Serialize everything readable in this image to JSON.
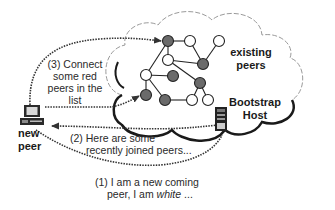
{
  "diagram": {
    "type": "p2p-bootstrap-join",
    "colors": {
      "gray_node": "#6a6a6a",
      "white_node": "#ffffff",
      "stroke": "#222222",
      "cloud_outline": "#1a1a1a",
      "dotted_arrow": "#333333",
      "text": "#2a2a2a"
    },
    "labels": {
      "existing_peers_line1": "existing",
      "existing_peers_line2": "peers",
      "bootstrap_line1": "Bootstrap",
      "bootstrap_line2": "Host",
      "new_peer_line1": "new",
      "new_peer_line2": "peer",
      "step3_line1": "(3) Connect",
      "step3_line2": "some red",
      "step3_line3": "peers in the",
      "step3_line4": "list",
      "step2_line1": "(2) Here are some",
      "step2_line2": "recently joined peers...",
      "step1_line1": "(1) I am a new coming",
      "step1_line2_prefix": "peer, I am ",
      "step1_line2_italic": "white",
      "step1_line2_suffix": " ..."
    },
    "nodes": [
      {
        "id": "A",
        "x": 168,
        "y": 41,
        "fill": "gray"
      },
      {
        "id": "B",
        "x": 190,
        "y": 41,
        "fill": "white"
      },
      {
        "id": "C",
        "x": 219,
        "y": 41,
        "fill": "white"
      },
      {
        "id": "D",
        "x": 168,
        "y": 60,
        "fill": "white"
      },
      {
        "id": "E",
        "x": 203,
        "y": 64,
        "fill": "gray"
      },
      {
        "id": "F",
        "x": 146,
        "y": 75,
        "fill": "white"
      },
      {
        "id": "G",
        "x": 173,
        "y": 76,
        "fill": "gray"
      },
      {
        "id": "H",
        "x": 200,
        "y": 83,
        "fill": "gray"
      },
      {
        "id": "I",
        "x": 146,
        "y": 95,
        "fill": "gray"
      },
      {
        "id": "J",
        "x": 165,
        "y": 100,
        "fill": "gray"
      },
      {
        "id": "K",
        "x": 192,
        "y": 100,
        "fill": "white"
      },
      {
        "id": "L",
        "x": 208,
        "y": 100,
        "fill": "white"
      }
    ],
    "edges": [
      [
        "A",
        "B"
      ],
      [
        "A",
        "D"
      ],
      [
        "A",
        "F"
      ],
      [
        "B",
        "E"
      ],
      [
        "C",
        "E"
      ],
      [
        "D",
        "E"
      ],
      [
        "D",
        "H"
      ],
      [
        "F",
        "G"
      ],
      [
        "F",
        "I"
      ],
      [
        "F",
        "J"
      ],
      [
        "J",
        "K"
      ],
      [
        "H",
        "K"
      ],
      [
        "H",
        "L"
      ]
    ],
    "arrows": [
      {
        "name": "step3-arrow-top",
        "from": "new-peer",
        "to": "A"
      },
      {
        "name": "step3-arrow-mid",
        "from": "new-peer",
        "to": "I"
      },
      {
        "name": "step2-arrow",
        "from": "bootstrap-host",
        "to": "new-peer"
      },
      {
        "name": "step1-arrow",
        "from": "new-peer",
        "to": "bootstrap-host"
      }
    ]
  }
}
